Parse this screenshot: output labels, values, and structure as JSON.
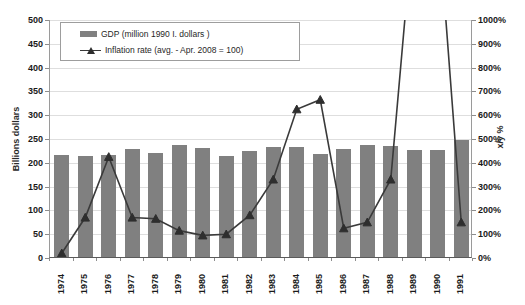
{
  "chart_data": {
    "type": "bar",
    "title": "",
    "xlabel": "",
    "ylabel": "Billions dollars",
    "y2label": "x/y %",
    "grid": true,
    "legend_position": "top-left",
    "categories": [
      "1974",
      "1975",
      "1976",
      "1977",
      "1978",
      "1979",
      "1980",
      "1981",
      "1982",
      "1983",
      "1984",
      "1985",
      "1986",
      "1987",
      "1988",
      "1989",
      "1990",
      "1991"
    ],
    "ylim": [
      0,
      500
    ],
    "y2lim": [
      0,
      1000
    ],
    "yticks": [
      "0",
      "50",
      "100",
      "150",
      "200",
      "250",
      "300",
      "350",
      "400",
      "450",
      "500"
    ],
    "y2ticks": [
      "0%",
      "100%",
      "200%",
      "300%",
      "400%",
      "500%",
      "600%",
      "700%",
      "800%",
      "900%",
      "1000%"
    ],
    "series": [
      {
        "name": "GDP (million 1990 I. dollars )",
        "type": "bar",
        "axis": "left",
        "unit": "Billions dollars",
        "color": "#808080",
        "values": [
          215,
          213,
          215,
          226,
          218,
          235,
          228,
          212,
          222,
          232,
          232,
          217,
          226,
          236,
          233,
          224,
          224,
          245
        ]
      },
      {
        "name": "Inflation rate (avg. - Apr. 2008 = 100)",
        "type": "line",
        "axis": "right",
        "unit": "x/y %",
        "color": "#3a3a3a",
        "marker": "triangle",
        "values": [
          20,
          170,
          425,
          170,
          165,
          115,
          95,
          100,
          180,
          330,
          625,
          665,
          125,
          150,
          330,
          1450,
          1450,
          150
        ],
        "offscale_note": "1989 and 1990 exceed the 1000% axis maximum"
      }
    ]
  },
  "legend": {
    "items": [
      {
        "label": "GDP (million 1990 I. dollars )",
        "swatch": "bar-swatch"
      },
      {
        "label": "Inflation  rate (avg. - Apr. 2008 = 100)",
        "swatch": "line-marker-swatch"
      }
    ]
  }
}
